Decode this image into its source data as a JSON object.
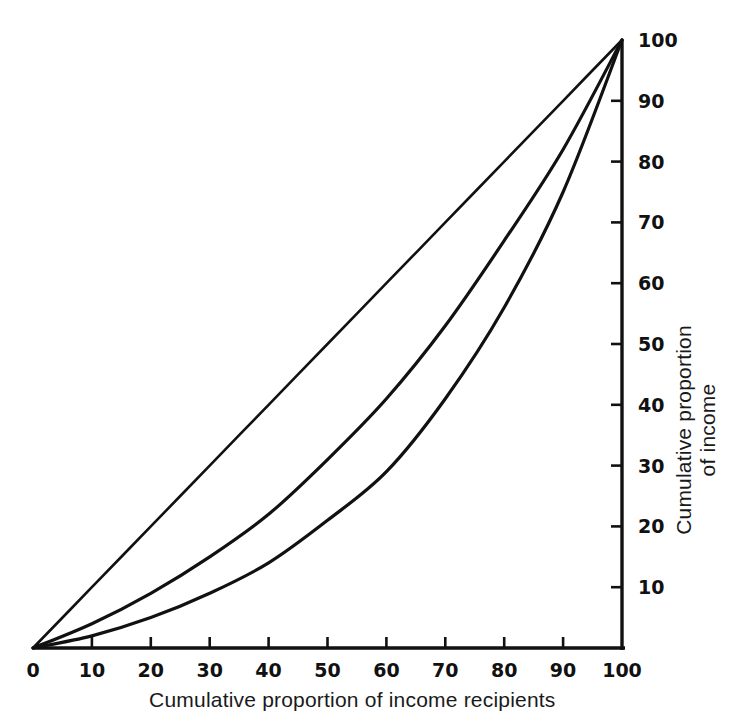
{
  "chart_data": {
    "type": "line",
    "title": "",
    "subtitle": "",
    "xlabel": "Cumulative proportion of income recipients",
    "ylabel_lines": [
      "Cumulative proportion",
      "of income"
    ],
    "ylabel": "Cumulative proportion of income",
    "xlim": [
      0,
      100
    ],
    "ylim": [
      0,
      100
    ],
    "grid": false,
    "legend": "none",
    "y_axis_position": "right",
    "x_axis_position": "bottom",
    "xticks": [
      0,
      10,
      20,
      30,
      40,
      50,
      60,
      70,
      80,
      90,
      100
    ],
    "xticklabels": [
      "0",
      "10",
      "20",
      "30",
      "40",
      "50",
      "60",
      "70",
      "80",
      "90",
      "100"
    ],
    "yticks": [
      10,
      20,
      30,
      40,
      50,
      60,
      70,
      80,
      90,
      100
    ],
    "yticklabels": [
      "10",
      "20",
      "30",
      "40",
      "50",
      "60",
      "70",
      "80",
      "90",
      "100"
    ],
    "line_color": "#111111",
    "background_color": "#ffffff",
    "x": [
      0,
      10,
      20,
      30,
      40,
      50,
      60,
      70,
      80,
      90,
      100
    ],
    "series": [
      {
        "name": "Line of equality",
        "annotation": "diagonal line of perfect equality",
        "values": [
          0,
          10,
          20,
          30,
          40,
          50,
          60,
          70,
          80,
          90,
          100
        ]
      },
      {
        "name": "Lorenz curve A",
        "annotation": "moderately unequal distribution",
        "values": [
          0,
          4,
          9,
          15,
          22,
          31,
          41,
          53,
          67,
          82,
          100
        ]
      },
      {
        "name": "Lorenz curve B",
        "annotation": "more unequal distribution",
        "values": [
          0,
          2,
          5,
          9,
          14,
          21,
          29,
          41,
          56,
          75,
          100
        ]
      }
    ]
  },
  "figure": {
    "x_axis_title": "Cumulative proportion of income recipients",
    "y_axis_title_line1": "Cumulative proportion",
    "y_axis_title_line2": "of income"
  }
}
